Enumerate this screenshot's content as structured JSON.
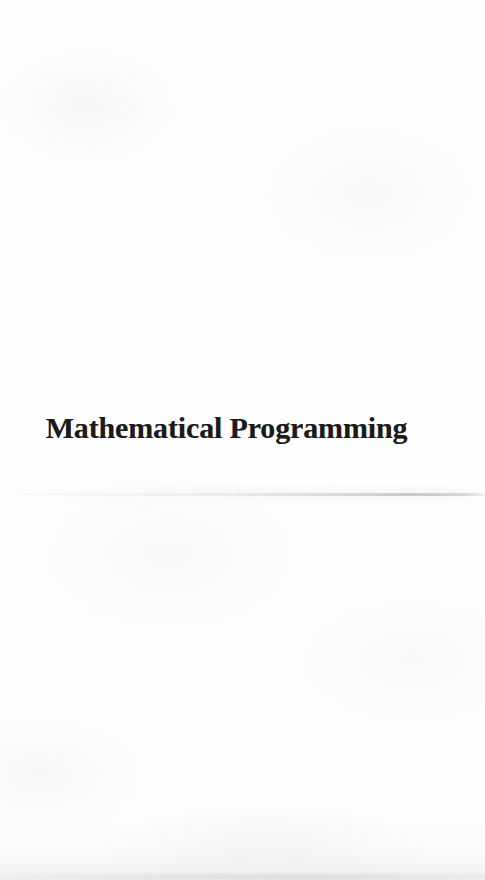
{
  "document": {
    "type": "scanned-book-part-title-page",
    "page_width": 485,
    "page_height": 880,
    "background_color": "#fefefe",
    "text_color": "#1b1b1b"
  },
  "title": {
    "text": "Mathematical Programming",
    "style": "bold serif",
    "font_size_px": 30,
    "alignment": "centered"
  },
  "artifacts": {
    "scan_streak": {
      "name": "horizontal-scan-streak",
      "approx_y": 494,
      "color": "#c4c4c9",
      "description": "faint horizontal grey streak across page, darkening toward the right edge"
    },
    "bottom_shading": {
      "name": "bottom-edge-shading",
      "color": "#dbdbdf",
      "description": "subtle grey shading along the bottom margin of the scan"
    },
    "paper_texture": {
      "name": "paper-grain",
      "color": "#f0f0f2",
      "description": "very faint mottled paper texture over the whole page"
    }
  }
}
